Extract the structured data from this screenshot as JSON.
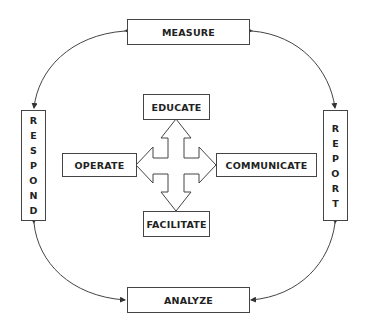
{
  "diagram": {
    "outer_cycle": {
      "top": "MEASURE",
      "right": "REPORT",
      "bottom": "ANALYZE",
      "left": "RESPOND"
    },
    "center_hub": {
      "top": "EDUCATE",
      "right": "COMMUNICATE",
      "bottom": "FACILITATE",
      "left": "OPERATE"
    },
    "connectors": [
      {
        "from": "MEASURE",
        "to": "REPORT",
        "type": "curved-double-arrow"
      },
      {
        "from": "REPORT",
        "to": "ANALYZE",
        "type": "curved-double-arrow"
      },
      {
        "from": "ANALYZE",
        "to": "RESPOND",
        "type": "curved-double-arrow"
      },
      {
        "from": "RESPOND",
        "to": "MEASURE",
        "type": "curved-double-arrow"
      }
    ],
    "center_shape": "four-way-arrow",
    "colors": {
      "line": "#444444",
      "text": "#222222",
      "background": "#ffffff"
    }
  },
  "respond_letters": [
    "R",
    "E",
    "S",
    "P",
    "O",
    "N",
    "D"
  ],
  "report_letters": [
    "R",
    "E",
    "P",
    "O",
    "R",
    "T"
  ]
}
